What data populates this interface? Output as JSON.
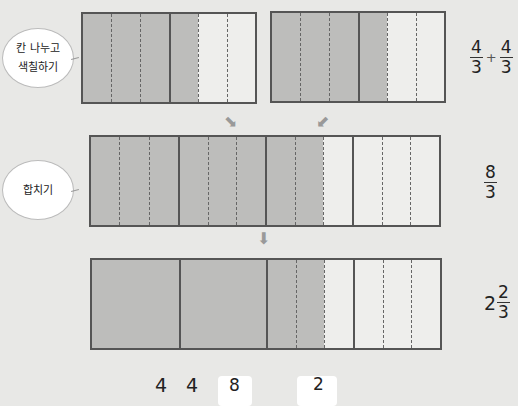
{
  "bubbles": {
    "step1": {
      "line1": "칸 나누고",
      "line2": "색칠하기"
    },
    "step2": {
      "label": "합치기"
    }
  },
  "row1": {
    "fraction_a": {
      "numerator": "4",
      "denominator": "3"
    },
    "operator": "+",
    "fraction_b": {
      "numerator": "4",
      "denominator": "3"
    },
    "left_bar": {
      "units": 2,
      "divisions": 3,
      "shaded_cells": 4
    },
    "right_bar": {
      "units": 2,
      "divisions": 3,
      "shaded_cells": 4
    }
  },
  "row2": {
    "fraction": {
      "numerator": "8",
      "denominator": "3"
    },
    "bar": {
      "units": 4,
      "divisions": 3,
      "shaded_cells": 8
    }
  },
  "row3": {
    "mixed": {
      "whole": "2",
      "numerator": "2",
      "denominator": "3"
    },
    "bar": {
      "units": 4,
      "divisions": 3,
      "whole_units_merged": 2,
      "shaded_cells": 8
    }
  },
  "equation": {
    "part1": "4",
    "part2": "4",
    "answer1": "8",
    "answer2": "2"
  },
  "arrows": {
    "down_right": "⬊",
    "down_left": "⬋",
    "down": "⬇"
  },
  "colors": {
    "shaded": "#bdbdbb",
    "empty": "#eeeeec",
    "border": "#555555",
    "background": "#e8e8e6"
  }
}
